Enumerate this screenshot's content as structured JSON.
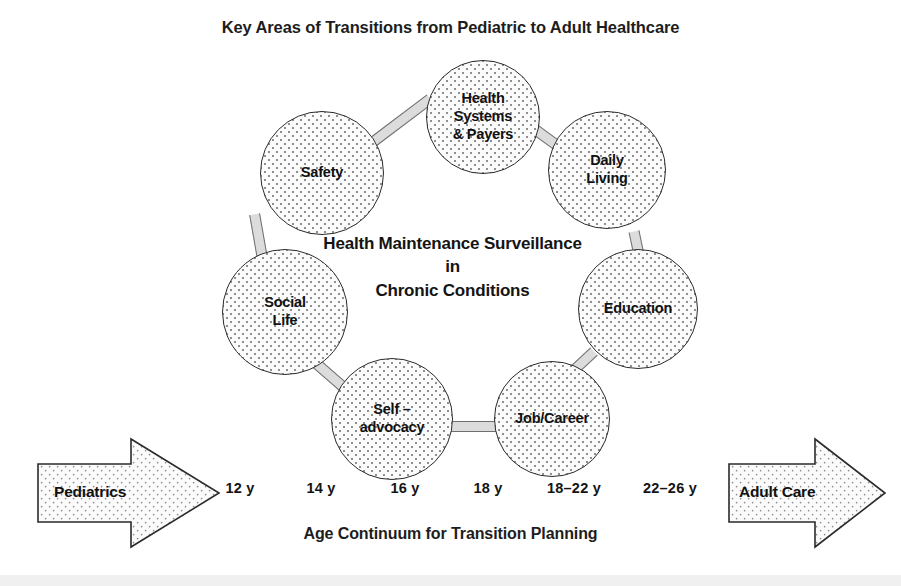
{
  "title": "Key Areas of Transitions from Pediatric to Adult Healthcare",
  "center": {
    "line1": "Health Maintenance Surveillance",
    "line2": "in",
    "line3": "Chronic Conditions"
  },
  "nodes": [
    {
      "id": "health-systems-payers",
      "label": "Health\nSystems\n& Payers"
    },
    {
      "id": "daily-living",
      "label": "Daily\nLiving"
    },
    {
      "id": "education",
      "label": "Education"
    },
    {
      "id": "job-career",
      "label": "Job/Career"
    },
    {
      "id": "self-advocacy",
      "label": "Self –\nadvocacy"
    },
    {
      "id": "social-life",
      "label": "Social\nLife"
    },
    {
      "id": "safety",
      "label": "Safety"
    }
  ],
  "arrows": {
    "left": {
      "label": "Pediatrics"
    },
    "right": {
      "label": "Adult Care"
    }
  },
  "age_continuum": {
    "caption": "Age Continuum for Transition Planning",
    "ticks": [
      "12 y",
      "14 y",
      "16 y",
      "18 y",
      "18–22 y",
      "22–26 y"
    ]
  },
  "colors": {
    "ink": "#1d1d1d",
    "circle_outline": "#2b2b2b",
    "circle_fill": "#fbfbfb",
    "stipple": "#8f8f8f",
    "connector": "#dcdcdc",
    "page_background": "#ffffff"
  }
}
